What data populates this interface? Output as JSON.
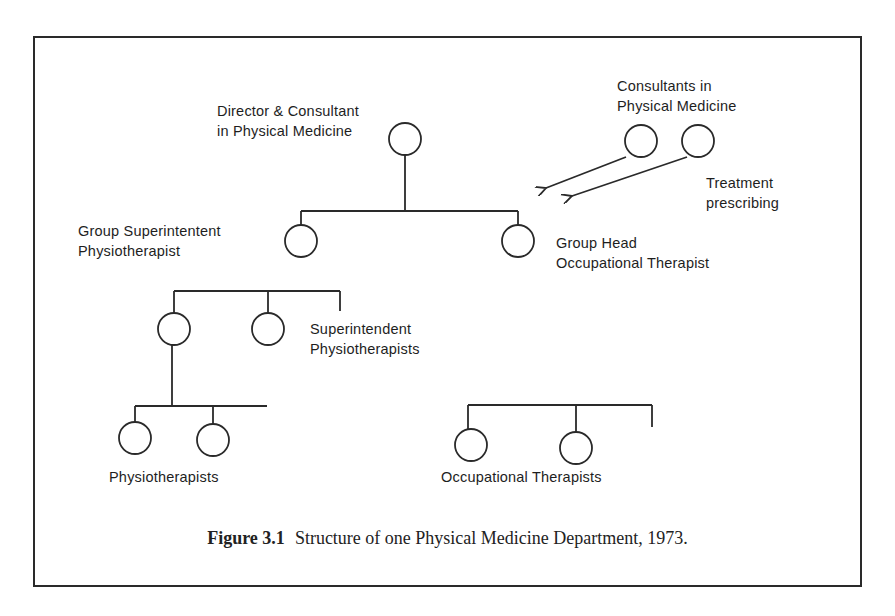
{
  "figure": {
    "number": "Figure 3.1",
    "caption": "Structure of one Physical Medicine Department, 1973."
  },
  "nodes": {
    "director": {
      "label_line1": "Director & Consultant",
      "label_line2": "in Physical Medicine"
    },
    "consultants": {
      "label_line1": "Consultants in",
      "label_line2": "Physical Medicine"
    },
    "treatment": {
      "label_line1": "Treatment",
      "label_line2": "prescribing"
    },
    "group_supt_physio": {
      "label_line1": "Group Superintentent",
      "label_line2": "Physiotherapist"
    },
    "group_head_ot": {
      "label_line1": "Group Head",
      "label_line2": "Occupational Therapist"
    },
    "supt_physios": {
      "label_line1": "Superintendent",
      "label_line2": "Physiotherapists"
    },
    "physios": {
      "label": "Physiotherapists"
    },
    "ots": {
      "label": "Occupational Therapists"
    }
  },
  "colors": {
    "line": "#2a2a2a",
    "text": "#1e1e1e",
    "background": "#ffffff"
  }
}
